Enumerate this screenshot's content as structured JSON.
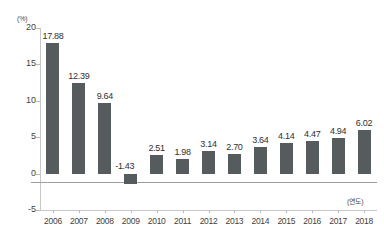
{
  "chart_data": {
    "type": "bar",
    "title": "",
    "subtitle": "",
    "xlabel": "(연도)",
    "ylabel": "(%)",
    "categories": [
      "2006",
      "2007",
      "2008",
      "2009",
      "2010",
      "2011",
      "2012",
      "2013",
      "2014",
      "2015",
      "2016",
      "2017",
      "2018"
    ],
    "values": [
      17.88,
      12.39,
      9.64,
      -1.43,
      2.51,
      1.98,
      3.14,
      2.7,
      3.64,
      4.14,
      4.47,
      4.94,
      6.02
    ],
    "value_labels": [
      "17.88",
      "12.39",
      "9.64",
      "-1.43",
      "2.51",
      "1.98",
      "3.14",
      "2.70",
      "3.64",
      "4.14",
      "4.47",
      "4.94",
      "6.02"
    ],
    "ylim": [
      -5,
      20
    ],
    "yticks": [
      20,
      15,
      10,
      5,
      0,
      -5
    ],
    "ytick_labels": [
      "20",
      "15",
      "10",
      "5",
      "0",
      "-5"
    ],
    "grid": false,
    "legend": "none",
    "series": [
      {
        "name": "",
        "values": [
          17.88,
          12.39,
          9.64,
          -1.43,
          2.51,
          1.98,
          3.14,
          2.7,
          3.64,
          4.14,
          4.47,
          4.94,
          6.02
        ],
        "color": "#565c5e"
      }
    ],
    "colors": {
      "bar": "#565c5e",
      "axis": "#c7c7c7",
      "zero_line": "#9d9d9d",
      "text": "#3b3b3b",
      "background": "#ffffff"
    }
  }
}
